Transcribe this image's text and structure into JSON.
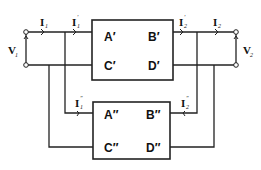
{
  "diagram": {
    "type": "two-port network parallel connection",
    "top_network": {
      "params": [
        "A′",
        "B′",
        "C′",
        "D′"
      ],
      "input_current": {
        "base": "I",
        "sub": "1",
        "prime": "′"
      },
      "output_current": {
        "base": "I",
        "sub": "2",
        "prime": "′"
      }
    },
    "bottom_network": {
      "params": [
        "A″",
        "B″",
        "C″",
        "D″"
      ],
      "input_current": {
        "base": "I",
        "sub": "1",
        "prime": "″"
      },
      "output_current": {
        "base": "I",
        "sub": "2",
        "prime": "″"
      }
    },
    "input": {
      "current": {
        "base": "I",
        "sub": "1"
      },
      "voltage": {
        "base": "V",
        "sub": "1"
      }
    },
    "output": {
      "current": {
        "base": "I",
        "sub": "2"
      },
      "voltage": {
        "base": "V",
        "sub": "2"
      }
    }
  }
}
